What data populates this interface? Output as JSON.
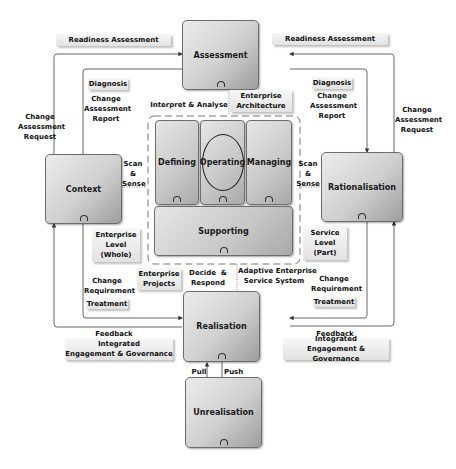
{
  "nodes": {
    "assessment": "Assessment",
    "context": "Context",
    "rationalisation": "Rationalisation",
    "realisation": "Realisation",
    "unrealisation": "Unrealisation",
    "defining": "Defining",
    "operating": "Operating",
    "managing": "Managing",
    "supporting": "Supporting"
  },
  "tags": {
    "readiness_left": "Readiness Assessment",
    "readiness_right": "Readiness Assessment",
    "diagnosis_left": "Diagnosis",
    "diagnosis_right": "Diagnosis",
    "enterprise_architecture_1": "Enterprise",
    "enterprise_architecture_2": "Architecture",
    "enterprise_level_1": "Enterprise",
    "enterprise_level_2": "Level",
    "enterprise_level_3": "(Whole)",
    "service_level_1": "Service",
    "service_level_2": "Level",
    "service_level_3": "(Part)",
    "treatment_left": "Treatment",
    "treatment_right": "Treatment",
    "enterprise_projects_1": "Enterprise",
    "enterprise_projects_2": "Projects",
    "integrated_left_1": "Integrated",
    "integrated_left_2": "Engagement & Governance",
    "integrated_right_1": "Integrated",
    "integrated_right_2": "Engagement & Governance"
  },
  "labels": {
    "change_req_left": [
      "Change",
      "Assessment",
      "Request"
    ],
    "change_req_right": [
      "Change",
      "Assessment",
      "Request"
    ],
    "change_report_left": [
      "Change",
      "Assessment",
      "Report"
    ],
    "change_report_right": [
      "Change",
      "Assessment",
      "Report"
    ],
    "interpret": "Interpret & Analyse",
    "scan_left": [
      "Scan",
      "&",
      "Sense"
    ],
    "scan_right": [
      "Scan",
      "&",
      "Sense"
    ],
    "change_requirement_left": [
      "Change",
      "Requirement"
    ],
    "change_requirement_right": [
      "Change",
      "Requirement"
    ],
    "decide": [
      "Decide  &",
      "Respond"
    ],
    "adaptive": [
      "Adaptive Enterprise",
      "Service System"
    ],
    "feedback_left": "Feedback",
    "feedback_right": "Feedback",
    "pull": "Pull",
    "push": "Push"
  }
}
